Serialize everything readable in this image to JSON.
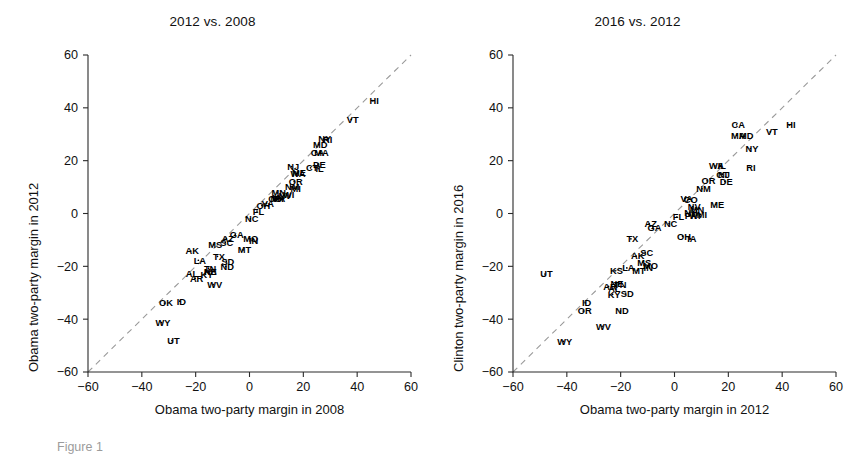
{
  "figure": {
    "caption": "Figure 1",
    "background": "#ffffff",
    "text_color": "#111111",
    "diagonal_color": "#9a9a9a",
    "axis_color": "#2a2a2a"
  },
  "chart_data": [
    {
      "type": "scatter",
      "panel_id": "left",
      "title": "2012 vs. 2008",
      "xlabel": "Obama two-party margin in 2008",
      "ylabel": "Obama two-party margin in 2012",
      "xlim": [
        -60,
        60
      ],
      "ylim": [
        -60,
        60
      ],
      "xticks": [
        -60,
        -40,
        -20,
        0,
        20,
        40,
        60
      ],
      "yticks": [
        -60,
        -40,
        -20,
        0,
        20,
        40,
        60
      ],
      "xtick_labels": [
        "-60",
        "-40",
        "-20",
        "0",
        "20",
        "40",
        "60"
      ],
      "ytick_labels": [
        "-60",
        "-40",
        "-20",
        "0",
        "20",
        "40",
        "60"
      ],
      "grid": false,
      "legend": "none",
      "reference_line": {
        "type": "identity",
        "style": "dashed",
        "from": [
          -60,
          -60
        ],
        "to": [
          60,
          60
        ]
      },
      "point_label_field": "state",
      "points": [
        {
          "state": "HI",
          "x": 45.8,
          "y": 42.7
        },
        {
          "state": "VT",
          "x": 37.8,
          "y": 35.6
        },
        {
          "state": "NY",
          "x": 27.4,
          "y": 28.2
        },
        {
          "state": "RI",
          "x": 28.5,
          "y": 27.8
        },
        {
          "state": "MA",
          "x": 26.2,
          "y": 23.1
        },
        {
          "state": "MD",
          "x": 25.7,
          "y": 26.1
        },
        {
          "state": "CA",
          "x": 24.7,
          "y": 23.1
        },
        {
          "state": "DE",
          "x": 25.4,
          "y": 18.7
        },
        {
          "state": "IL",
          "x": 25.5,
          "y": 17.0
        },
        {
          "state": "NJ",
          "x": 15.7,
          "y": 17.8
        },
        {
          "state": "CT",
          "x": 22.7,
          "y": 17.3
        },
        {
          "state": "WA",
          "x": 17.5,
          "y": 15.0
        },
        {
          "state": "ME",
          "x": 17.8,
          "y": 15.3
        },
        {
          "state": "OR",
          "x": 16.6,
          "y": 12.1
        },
        {
          "state": "MI",
          "x": 16.6,
          "y": 9.6
        },
        {
          "state": "NM",
          "x": 15.3,
          "y": 10.2
        },
        {
          "state": "MN",
          "x": 10.3,
          "y": 7.8
        },
        {
          "state": "WI",
          "x": 14.0,
          "y": 7.0
        },
        {
          "state": "NV",
          "x": 12.6,
          "y": 6.8
        },
        {
          "state": "IA",
          "x": 9.6,
          "y": 5.9
        },
        {
          "state": "NH",
          "x": 9.7,
          "y": 5.6
        },
        {
          "state": "PA",
          "x": 10.4,
          "y": 5.5
        },
        {
          "state": "CO",
          "x": 9.0,
          "y": 5.5
        },
        {
          "state": "VA",
          "x": 6.3,
          "y": 3.9
        },
        {
          "state": "OH",
          "x": 4.6,
          "y": 3.0
        },
        {
          "state": "FL",
          "x": 2.8,
          "y": 0.9
        },
        {
          "state": "NC",
          "x": 0.3,
          "y": -2.0
        },
        {
          "state": "IN",
          "x": 1.0,
          "y": -10.3
        },
        {
          "state": "MO",
          "x": -0.1,
          "y": -9.5
        },
        {
          "state": "MT",
          "x": -2.4,
          "y": -13.8
        },
        {
          "state": "GA",
          "x": -5.3,
          "y": -8.0
        },
        {
          "state": "SC",
          "x": -9.0,
          "y": -10.9
        },
        {
          "state": "AZ",
          "x": -8.6,
          "y": -9.4
        },
        {
          "state": "SD",
          "x": -8.6,
          "y": -18.1
        },
        {
          "state": "ND",
          "x": -8.8,
          "y": -20.1
        },
        {
          "state": "MS",
          "x": -13.3,
          "y": -11.8
        },
        {
          "state": "TX",
          "x": -11.9,
          "y": -16.2
        },
        {
          "state": "TN",
          "x": -15.2,
          "y": -20.7
        },
        {
          "state": "WV",
          "x": -13.5,
          "y": -26.9
        },
        {
          "state": "LA",
          "x": -19.0,
          "y": -17.7
        },
        {
          "state": "AK",
          "x": -21.8,
          "y": -14.2
        },
        {
          "state": "NE",
          "x": -15.1,
          "y": -21.9
        },
        {
          "state": "KS",
          "x": -15.1,
          "y": -22.1
        },
        {
          "state": "KY",
          "x": -16.4,
          "y": -23.0
        },
        {
          "state": "AL",
          "x": -21.9,
          "y": -22.9
        },
        {
          "state": "AR",
          "x": -20.2,
          "y": -24.5
        },
        {
          "state": "OK",
          "x": -31.6,
          "y": -33.9
        },
        {
          "state": "ID",
          "x": -25.9,
          "y": -33.2
        },
        {
          "state": "WY",
          "x": -32.7,
          "y": -41.3
        },
        {
          "state": "UT",
          "x": -28.8,
          "y": -48.1
        }
      ]
    },
    {
      "type": "scatter",
      "panel_id": "right",
      "title": "2016 vs. 2012",
      "xlabel": "Obama two-party margin in 2012",
      "ylabel": "Clinton two-party margin in 2016",
      "xlim": [
        -60,
        60
      ],
      "ylim": [
        -60,
        60
      ],
      "xticks": [
        -60,
        -40,
        -20,
        0,
        20,
        40,
        60
      ],
      "yticks": [
        -60,
        -40,
        -20,
        0,
        20,
        40,
        60
      ],
      "xtick_labels": [
        "-60",
        "-40",
        "-20",
        "0",
        "20",
        "40",
        "60"
      ],
      "ytick_labels": [
        "-60",
        "-40",
        "-20",
        "0",
        "20",
        "40",
        "60"
      ],
      "grid": false,
      "legend": "none",
      "reference_line": {
        "type": "identity",
        "style": "dashed",
        "from": [
          -60,
          -60
        ],
        "to": [
          60,
          60
        ]
      },
      "point_label_field": "state",
      "points": [
        {
          "state": "HI",
          "x": 42.7,
          "y": 33.5
        },
        {
          "state": "VT",
          "x": 35.6,
          "y": 30.9
        },
        {
          "state": "CA",
          "x": 23.1,
          "y": 33.6
        },
        {
          "state": "MA",
          "x": 23.1,
          "y": 29.6
        },
        {
          "state": "MD",
          "x": 26.1,
          "y": 29.3
        },
        {
          "state": "NY",
          "x": 28.2,
          "y": 24.6
        },
        {
          "state": "RI",
          "x": 27.8,
          "y": 17.5
        },
        {
          "state": "IL",
          "x": 17.0,
          "y": 18.1
        },
        {
          "state": "WA",
          "x": 15.0,
          "y": 18.0
        },
        {
          "state": "CT",
          "x": 17.3,
          "y": 14.7
        },
        {
          "state": "NJ",
          "x": 17.8,
          "y": 14.9
        },
        {
          "state": "OR",
          "x": 12.1,
          "y": 12.4
        },
        {
          "state": "DE",
          "x": 18.7,
          "y": 12.1
        },
        {
          "state": "NM",
          "x": 10.2,
          "y": 9.4
        },
        {
          "state": "VA",
          "x": 3.9,
          "y": 5.8
        },
        {
          "state": "CO",
          "x": 5.5,
          "y": 5.4
        },
        {
          "state": "NV",
          "x": 6.8,
          "y": 2.6
        },
        {
          "state": "MN",
          "x": 7.8,
          "y": 1.6
        },
        {
          "state": "NH",
          "x": 5.6,
          "y": 0.4
        },
        {
          "state": "ME",
          "x": 15.3,
          "y": 3.4
        },
        {
          "state": "MI",
          "x": 9.6,
          "y": -0.3
        },
        {
          "state": "AZ",
          "x": -9.4,
          "y": -3.9
        },
        {
          "state": "GA",
          "x": -8.0,
          "y": -5.3
        },
        {
          "state": "NC",
          "x": -2.0,
          "y": -3.8
        },
        {
          "state": "PA",
          "x": 5.5,
          "y": -0.8
        },
        {
          "state": "WI",
          "x": 7.0,
          "y": -0.8
        },
        {
          "state": "FL",
          "x": 0.9,
          "y": -1.3
        },
        {
          "state": "OH",
          "x": 3.0,
          "y": -8.6
        },
        {
          "state": "IA",
          "x": 5.9,
          "y": -9.6
        },
        {
          "state": "TX",
          "x": -16.2,
          "y": -9.6
        },
        {
          "state": "SC",
          "x": -10.9,
          "y": -14.8
        },
        {
          "state": "AK",
          "x": -14.2,
          "y": -16.1
        },
        {
          "state": "MS",
          "x": -11.8,
          "y": -18.4
        },
        {
          "state": "LA",
          "x": -17.7,
          "y": -20.6
        },
        {
          "state": "MO",
          "x": -9.5,
          "y": -19.7
        },
        {
          "state": "KS",
          "x": -22.1,
          "y": -21.6
        },
        {
          "state": "MT",
          "x": -13.8,
          "y": -21.5
        },
        {
          "state": "IN",
          "x": -10.3,
          "y": -20.5
        },
        {
          "state": "AL",
          "x": -22.9,
          "y": -28.5
        },
        {
          "state": "NE",
          "x": -21.9,
          "y": -26.5
        },
        {
          "state": "AR",
          "x": -24.5,
          "y": -27.6
        },
        {
          "state": "TN",
          "x": -20.7,
          "y": -26.8
        },
        {
          "state": "UT",
          "x": -48.1,
          "y": -22.9
        },
        {
          "state": "KY",
          "x": -23.0,
          "y": -30.6
        },
        {
          "state": "SD",
          "x": -18.1,
          "y": -30.4
        },
        {
          "state": "ID",
          "x": -33.2,
          "y": -33.8
        },
        {
          "state": "OR2",
          "x": -33.9,
          "y": -36.9
        },
        {
          "state": "ND",
          "x": -20.1,
          "y": -36.9
        },
        {
          "state": "WV",
          "x": -26.9,
          "y": -42.7
        },
        {
          "state": "WY",
          "x": -41.3,
          "y": -48.4
        }
      ]
    }
  ]
}
